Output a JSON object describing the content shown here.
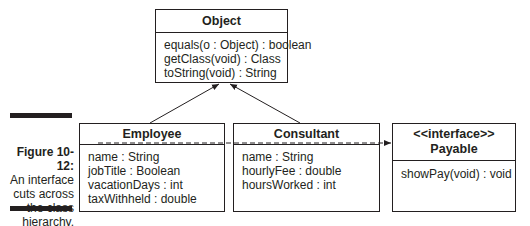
{
  "caption": {
    "figure": "Figure 10-12:",
    "lines": [
      "An interface",
      "cuts across",
      "the class",
      "hierarchy."
    ]
  },
  "classes": {
    "object": {
      "name": "Object",
      "members": [
        "equals(o : Object) : boolean",
        "getClass(void) : Class",
        "toString(void) : String"
      ]
    },
    "employee": {
      "name": "Employee",
      "members": [
        "name : String",
        "jobTitle : Boolean",
        "vacationDays : int",
        "taxWithheld : double"
      ]
    },
    "consultant": {
      "name": "Consultant",
      "members": [
        "name : String",
        "hourlyFee : double",
        "hoursWorked : int"
      ]
    },
    "payable": {
      "stereotype": "<<interface>>",
      "name": "Payable",
      "members": [
        "showPay(void) : void"
      ]
    }
  },
  "relations": [
    {
      "from": "Employee",
      "to": "Object",
      "type": "inheritance"
    },
    {
      "from": "Consultant",
      "to": "Object",
      "type": "inheritance"
    },
    {
      "from": "Employee",
      "to": "Payable",
      "type": "implements-dashed"
    }
  ]
}
